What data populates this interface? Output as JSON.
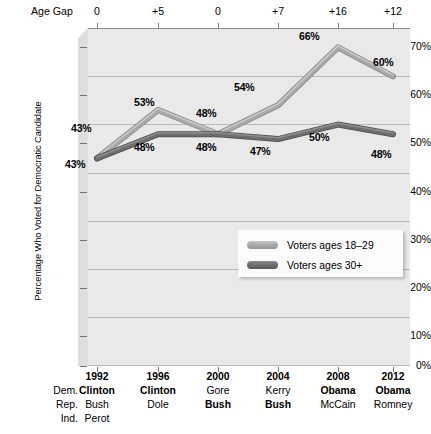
{
  "chart_data": {
    "type": "line",
    "title": "",
    "xlabel": "",
    "ylabel": "Percentage Who Voted for Democratic Candidate",
    "ylim": [
      0,
      70
    ],
    "ytick_labels": [
      "0%",
      "10%",
      "20%",
      "30%",
      "40%",
      "50%",
      "60%",
      "70%"
    ],
    "ytick_values": [
      0,
      10,
      20,
      30,
      40,
      50,
      60,
      70
    ],
    "grid": true,
    "legend_position": "inside-lower-right",
    "categories": [
      "1992",
      "1996",
      "2000",
      "2004",
      "2008",
      "2012"
    ],
    "series": [
      {
        "name": "Voters ages 18–29",
        "color": "#a9a9a9",
        "values": [
          43,
          53,
          48,
          54,
          66,
          60
        ],
        "value_labels": [
          "43%",
          "53%",
          "48%",
          "54%",
          "66%",
          "60%"
        ]
      },
      {
        "name": "Voters ages 30+",
        "color": "#6e6e6e",
        "values": [
          43,
          48,
          48,
          47,
          50,
          48
        ],
        "value_labels": [
          "43%",
          "48%",
          "48%",
          "47%",
          "50%",
          "48%"
        ]
      }
    ],
    "annotations": {
      "age_gap_row_label": "Age Gap",
      "age_gap_values": [
        "0",
        "+5",
        "0",
        "+7",
        "+16",
        "+12"
      ]
    }
  },
  "axis": {
    "y_title": "Percentage Who Voted for Democratic Candidate",
    "y_ticks": [
      "70%",
      "60%",
      "50%",
      "40%",
      "30%",
      "20%",
      "10%",
      "0%"
    ]
  },
  "agegap": {
    "label": "Age Gap",
    "values": [
      "0",
      "+5",
      "0",
      "+7",
      "+16",
      "+12"
    ]
  },
  "legend": {
    "items": [
      {
        "label": "Voters ages 18–29",
        "color": "#a9a9a9"
      },
      {
        "label": "Voters ages 30+",
        "color": "#6e6e6e"
      }
    ]
  },
  "point_labels": {
    "youth": [
      "43%",
      "53%",
      "48%",
      "54%",
      "66%",
      "60%"
    ],
    "older": [
      "43%",
      "48%",
      "48%",
      "47%",
      "50%",
      "48%"
    ]
  },
  "bottom_table": {
    "row_labels": [
      "",
      "Dem.",
      "Rep.",
      "Ind."
    ],
    "years": [
      "1992",
      "1996",
      "2000",
      "2004",
      "2008",
      "2012"
    ],
    "dem": [
      "Clinton",
      "Clinton",
      "Gore",
      "Kerry",
      "Obama",
      "Obama"
    ],
    "dem_bold": [
      true,
      true,
      false,
      false,
      true,
      true
    ],
    "rep": [
      "Bush",
      "Dole",
      "Bush",
      "Bush",
      "McCain",
      "Romney"
    ],
    "rep_bold": [
      false,
      false,
      true,
      true,
      false,
      false
    ],
    "ind": [
      "Perot",
      "",
      "",
      "",
      "",
      ""
    ],
    "ind_bold": [
      false,
      false,
      false,
      false,
      false,
      false
    ]
  },
  "colors": {
    "plot_background": "#e9e9e9",
    "gridline": "#b9b9b9",
    "youth_line": "#a9a9a9",
    "older_line": "#6e6e6e",
    "axis": "#8a8a8a"
  }
}
